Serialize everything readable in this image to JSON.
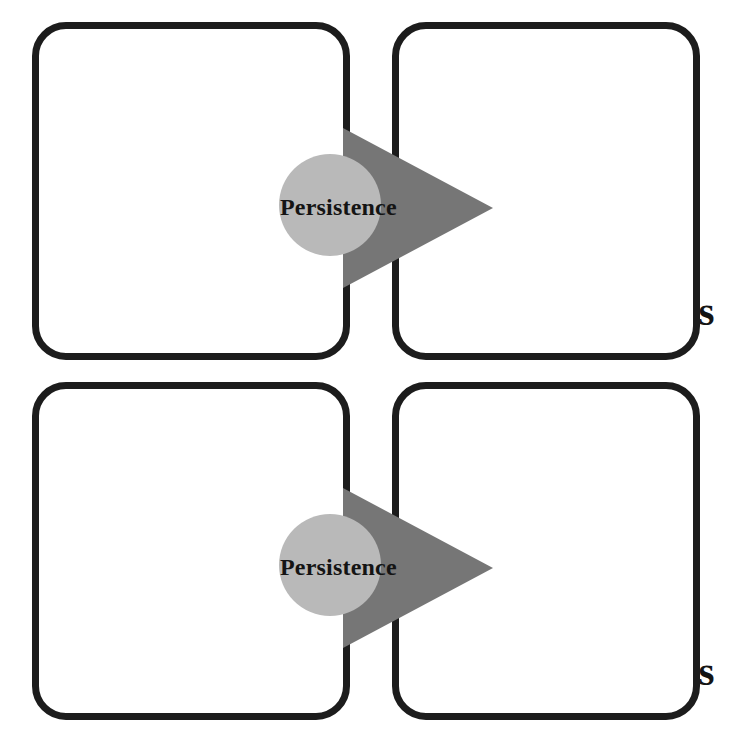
{
  "diagram": {
    "type": "flow-diagram",
    "background_color": "#ffffff",
    "rows": [
      {
        "left_box": {
          "label": "Blocker"
        },
        "right_box": {
          "label": "Actions"
        },
        "connector": {
          "arrow_label": "Persistence",
          "arrow_direction": "right",
          "arrow_color": "#767676",
          "circle_color": "#b9b9b9"
        }
      },
      {
        "left_box": {
          "label": "Blocker"
        },
        "right_box": {
          "label": "Actions"
        },
        "connector": {
          "arrow_label": "Persistence",
          "arrow_direction": "right",
          "arrow_color": "#767676",
          "circle_color": "#b9b9b9"
        }
      }
    ],
    "colors": {
      "box_border": "#1c1c1c",
      "text": "#141414",
      "arrow_fill": "#767676",
      "circle_fill": "#b9b9b9"
    }
  }
}
